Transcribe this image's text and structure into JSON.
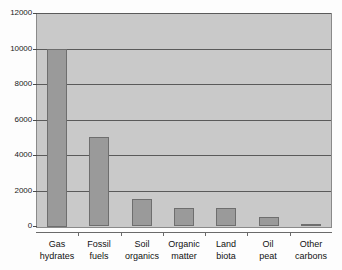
{
  "chart_data": {
    "type": "bar",
    "title": "",
    "xlabel": "",
    "ylabel": "",
    "ylim": [
      0,
      12000
    ],
    "grid": true,
    "legend": "none",
    "categories": [
      "Gas hydrates",
      "Fossil fuels",
      "Soil organics",
      "Organic matter",
      "Land biota",
      "Oil peat",
      "Other carbons"
    ],
    "category_lines": [
      [
        "Gas",
        "hydrates"
      ],
      [
        "Fossil",
        "fuels"
      ],
      [
        "Soil",
        "organics"
      ],
      [
        "Organic",
        "matter"
      ],
      [
        "Land",
        "biota"
      ],
      [
        "Oil",
        "peat"
      ],
      [
        "Other",
        "carbons"
      ]
    ],
    "values": [
      10000,
      5000,
      1500,
      1000,
      1000,
      500,
      100
    ],
    "ytick_labels": [
      "0",
      "2000",
      "4000",
      "6000",
      "8000",
      "10000",
      "12000"
    ],
    "ytick_values": [
      0,
      2000,
      4000,
      6000,
      8000,
      10000,
      12000
    ],
    "colors": {
      "bar_fill": "#9a9a9a",
      "bar_border": "#6e6e6e",
      "plot_background": "#c9c9c9",
      "gridline": "#5a5a5a",
      "axis": "#6a6a6a",
      "text": "#111111",
      "page_background": "#fdfdfd"
    }
  }
}
